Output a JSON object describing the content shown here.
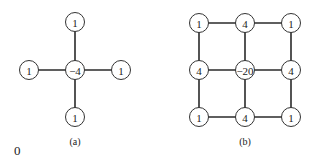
{
  "diagrams": [
    {
      "caption": "(a)",
      "caption_pos": [
        75,
        145
      ],
      "nodes": [
        {
          "id": "top",
          "label": "1",
          "x": 75,
          "y": 22
        },
        {
          "id": "left",
          "label": "1",
          "x": 29,
          "y": 70
        },
        {
          "id": "center",
          "label": "-4",
          "x": 75,
          "y": 70
        },
        {
          "id": "right",
          "label": "1",
          "x": 121,
          "y": 70
        },
        {
          "id": "bottom",
          "label": "1",
          "x": 75,
          "y": 117
        }
      ],
      "edges": [
        [
          "top",
          "center"
        ],
        [
          "left",
          "center"
        ],
        [
          "center",
          "right"
        ],
        [
          "center",
          "bottom"
        ]
      ]
    },
    {
      "caption": "(b)",
      "caption_pos": [
        245,
        145
      ],
      "nodes": [
        {
          "id": "r0c0",
          "label": "1",
          "x": 199,
          "y": 23
        },
        {
          "id": "r0c1",
          "label": "4",
          "x": 245,
          "y": 23
        },
        {
          "id": "r0c2",
          "label": "1",
          "x": 291,
          "y": 23
        },
        {
          "id": "r1c0",
          "label": "4",
          "x": 199,
          "y": 70
        },
        {
          "id": "r1c1",
          "label": "-20",
          "x": 245,
          "y": 70
        },
        {
          "id": "r1c2",
          "label": "4",
          "x": 291,
          "y": 70
        },
        {
          "id": "r2c0",
          "label": "1",
          "x": 199,
          "y": 117
        },
        {
          "id": "r2c1",
          "label": "4",
          "x": 245,
          "y": 117
        },
        {
          "id": "r2c2",
          "label": "1",
          "x": 291,
          "y": 117
        }
      ],
      "edges": [
        [
          "r0c0",
          "r0c1"
        ],
        [
          "r0c1",
          "r0c2"
        ],
        [
          "r1c0",
          "r1c1"
        ],
        [
          "r1c1",
          "r1c2"
        ],
        [
          "r2c0",
          "r2c1"
        ],
        [
          "r2c1",
          "r2c2"
        ],
        [
          "r0c0",
          "r1c0"
        ],
        [
          "r1c0",
          "r2c0"
        ],
        [
          "r0c1",
          "r1c1"
        ],
        [
          "r1c1",
          "r2c1"
        ],
        [
          "r0c2",
          "r1c2"
        ],
        [
          "r1c2",
          "r2c2"
        ]
      ]
    }
  ],
  "stray_text": {
    "label": "0",
    "x": 14,
    "y": 158
  },
  "node_radius": 9.5
}
